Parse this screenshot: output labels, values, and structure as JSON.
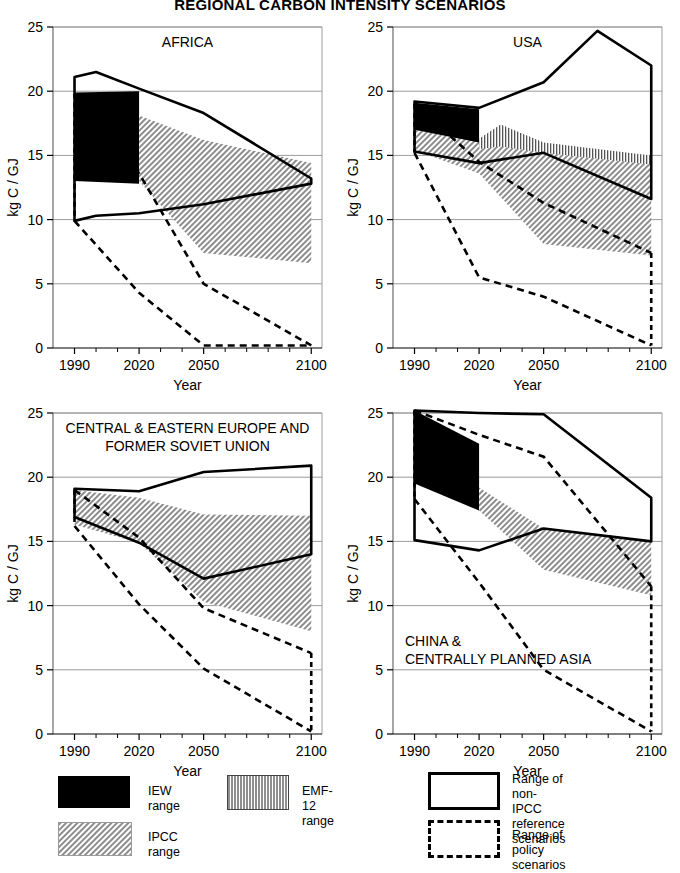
{
  "figure": {
    "title": "REGIONAL CARBON INTENSITY SCENARIOS"
  },
  "axes": {
    "ylabel": "kg C / GJ",
    "xlabel": "Year",
    "yticks": [
      "0",
      "5",
      "10",
      "15",
      "20",
      "25"
    ],
    "xticks": [
      "1990",
      "2020",
      "2050",
      "2100"
    ]
  },
  "legend": {
    "items": [
      {
        "name": "iew",
        "label": "IEW range",
        "swatch": "solid-black"
      },
      {
        "name": "emf12",
        "label": "EMF-12 range",
        "swatch": "vertical-hatch"
      },
      {
        "name": "ipcc",
        "label": "IPCC range",
        "swatch": "diagonal-gray-hatch"
      },
      {
        "name": "non-ipcc-reference",
        "label": "Range of non-IPCC\nreference scenarios",
        "swatch": "solid-outline-box"
      },
      {
        "name": "policy",
        "label": "Range of policy scenarios",
        "swatch": "dashed-outline-box"
      }
    ]
  },
  "chart_data": {
    "type": "area",
    "title": "REGIONAL CARBON INTENSITY SCENARIOS",
    "xlabel": "Year",
    "ylabel": "kg C / GJ",
    "xlim": [
      1980,
      2105
    ],
    "ylim": [
      0,
      25
    ],
    "xticks": [
      1990,
      2020,
      2050,
      2100
    ],
    "yticks": [
      0,
      5,
      10,
      15,
      20,
      25
    ],
    "grid": "horizontal",
    "legend_position": "below-panels",
    "panels": [
      {
        "name": "africa",
        "label": "AFRICA",
        "label_pos": "top-center",
        "series": [
          {
            "name": "Range of non-IPCC reference scenarios",
            "style": "solid-outline",
            "upper": {
              "x": [
                1990,
                2000,
                2020,
                2050,
                2100
              ],
              "y": [
                21.1,
                21.5,
                20.2,
                18.3,
                13.2
              ]
            },
            "lower": {
              "x": [
                1990,
                2000,
                2020,
                2050,
                2100
              ],
              "y": [
                9.9,
                10.3,
                10.5,
                11.2,
                12.8
              ]
            }
          },
          {
            "name": "Range of policy scenarios",
            "style": "dashed-outline",
            "upper": {
              "x": [
                1990,
                2020,
                2050,
                2100
              ],
              "y": [
                19.8,
                13.6,
                5.0,
                0.2
              ]
            },
            "lower": {
              "x": [
                1990,
                2020,
                2050,
                2100
              ],
              "y": [
                9.9,
                4.3,
                0.2,
                0.2
              ]
            }
          },
          {
            "name": "IEW range",
            "style": "solid-black-fill",
            "upper": {
              "x": [
                1990,
                2020
              ],
              "y": [
                19.9,
                20.0
              ]
            },
            "lower": {
              "x": [
                1990,
                2020
              ],
              "y": [
                13.0,
                12.8
              ]
            }
          },
          {
            "name": "IPCC range",
            "style": "gray-diagonal-fill",
            "upper": {
              "x": [
                2020,
                2050,
                2100
              ],
              "y": [
                18.1,
                16.2,
                14.4
              ]
            },
            "lower": {
              "x": [
                2020,
                2050,
                2100
              ],
              "y": [
                13.0,
                7.4,
                6.6
              ]
            }
          }
        ]
      },
      {
        "name": "usa",
        "label": "USA",
        "label_pos": "top-center",
        "series": [
          {
            "name": "Range of non-IPCC reference scenarios",
            "style": "solid-outline",
            "upper": {
              "x": [
                1990,
                2020,
                2050,
                2075,
                2100
              ],
              "y": [
                19.2,
                18.7,
                20.7,
                24.7,
                22.0
              ]
            },
            "lower": {
              "x": [
                1990,
                2020,
                2050,
                2100
              ],
              "y": [
                15.3,
                14.4,
                15.2,
                11.6
              ]
            }
          },
          {
            "name": "Range of policy scenarios",
            "style": "dashed-outline",
            "upper": {
              "x": [
                1990,
                2020,
                2050,
                2100
              ],
              "y": [
                19.0,
                14.5,
                11.3,
                7.4
              ]
            },
            "lower": {
              "x": [
                1990,
                2020,
                2050,
                2100
              ],
              "y": [
                15.2,
                5.5,
                4.0,
                0.2
              ]
            }
          },
          {
            "name": "IEW range",
            "style": "solid-black-fill",
            "upper": {
              "x": [
                1990,
                2020
              ],
              "y": [
                19.1,
                18.6
              ]
            },
            "lower": {
              "x": [
                1990,
                2020
              ],
              "y": [
                17.0,
                15.5
              ]
            }
          },
          {
            "name": "IPCC range",
            "style": "gray-diagonal-fill",
            "upper": {
              "x": [
                1990,
                2020,
                2030,
                2050,
                2100
              ],
              "y": [
                17.0,
                16.0,
                17.4,
                16.0,
                14.5
              ]
            },
            "lower": {
              "x": [
                1990,
                2020,
                2050,
                2100
              ],
              "y": [
                15.4,
                13.6,
                8.1,
                7.2
              ]
            }
          },
          {
            "name": "EMF-12 range",
            "style": "vertical-hatch-fill",
            "upper": {
              "x": [
                2020,
                2030,
                2050,
                2100
              ],
              "y": [
                16.3,
                17.4,
                16.0,
                15.0
              ]
            },
            "lower": {
              "x": [
                2020,
                2030,
                2050,
                2100
              ],
              "y": [
                15.5,
                15.7,
                15.2,
                14.3
              ]
            }
          }
        ]
      },
      {
        "name": "cee-fsu",
        "label": "CENTRAL & EASTERN EUROPE AND\nFORMER SOVIET UNION",
        "label_pos": "top-center",
        "series": [
          {
            "name": "Range of non-IPCC reference scenarios",
            "style": "solid-outline",
            "upper": {
              "x": [
                1990,
                2020,
                2050,
                2100
              ],
              "y": [
                19.1,
                18.9,
                20.4,
                20.9
              ]
            },
            "lower": {
              "x": [
                1990,
                2020,
                2050,
                2100
              ],
              "y": [
                16.9,
                14.9,
                12.1,
                14.0
              ]
            }
          },
          {
            "name": "Range of policy scenarios",
            "style": "dashed-outline",
            "upper": {
              "x": [
                1990,
                2020,
                2050,
                2100
              ],
              "y": [
                19.0,
                15.3,
                9.8,
                6.3
              ]
            },
            "lower": {
              "x": [
                1990,
                2020,
                2050,
                2100
              ],
              "y": [
                16.2,
                10.1,
                5.1,
                0.2
              ]
            }
          },
          {
            "name": "IEW range",
            "style": "solid-black-fill",
            "upper": {
              "x": [
                1990,
                2020
              ],
              "y": [
                17.9,
                16.8
              ]
            },
            "lower": {
              "x": [
                1990,
                2020
              ],
              "y": [
                16.8,
                15.6
              ]
            }
          },
          {
            "name": "IPCC range",
            "style": "gray-diagonal-fill",
            "upper": {
              "x": [
                1990,
                2020,
                2050,
                2100
              ],
              "y": [
                19.0,
                18.4,
                17.1,
                17.0
              ]
            },
            "lower": {
              "x": [
                1990,
                2020,
                2050,
                2100
              ],
              "y": [
                16.3,
                14.9,
                10.3,
                8.0
              ]
            }
          }
        ]
      },
      {
        "name": "china-cpa",
        "label": "CHINA &\nCENTRALLY PLANNED ASIA",
        "label_pos": "bottom-left",
        "series": [
          {
            "name": "Range of non-IPCC reference scenarios",
            "style": "solid-outline",
            "upper": {
              "x": [
                1990,
                2020,
                2050,
                2100
              ],
              "y": [
                25.2,
                25.0,
                24.9,
                18.4
              ]
            },
            "lower": {
              "x": [
                1990,
                2020,
                2050,
                2100
              ],
              "y": [
                15.1,
                14.3,
                16.0,
                15.0
              ]
            }
          },
          {
            "name": "Range of policy scenarios",
            "style": "dashed-outline",
            "upper": {
              "x": [
                1990,
                2020,
                2050,
                2100
              ],
              "y": [
                25.2,
                23.3,
                21.6,
                11.5
              ]
            },
            "lower": {
              "x": [
                1990,
                2020,
                2050,
                2100
              ],
              "y": [
                18.3,
                11.8,
                5.0,
                0.2
              ]
            }
          },
          {
            "name": "IEW range",
            "style": "solid-black-fill",
            "upper": {
              "x": [
                1990,
                2020
              ],
              "y": [
                25.2,
                22.6
              ]
            },
            "lower": {
              "x": [
                1990,
                2020
              ],
              "y": [
                19.5,
                17.4
              ]
            }
          },
          {
            "name": "IPCC range",
            "style": "gray-diagonal-fill",
            "upper": {
              "x": [
                2020,
                2050,
                2100
              ],
              "y": [
                19.2,
                16.0,
                15.0
              ]
            },
            "lower": {
              "x": [
                2020,
                2050,
                2100
              ],
              "y": [
                17.4,
                12.8,
                10.8
              ]
            }
          }
        ]
      }
    ]
  }
}
